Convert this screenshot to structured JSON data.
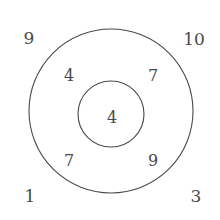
{
  "figure": {
    "type": "concentric-circle-region-diagram",
    "background_color": "#ffffff",
    "stroke_color": "#4a4a4a",
    "text_color": "#4a4a4a"
  },
  "shapes": {
    "outer_circle": {
      "name": "outer-circle",
      "cx": 111,
      "cy": 111,
      "r": 82,
      "stroke": "#4a4a4a",
      "stroke_width": 1.1,
      "fill": "none"
    },
    "inner_circle": {
      "name": "inner-circle",
      "cx": 111,
      "cy": 114,
      "r": 33,
      "stroke": "#4a4a4a",
      "stroke_width": 1.1,
      "fill": "none"
    }
  },
  "labels": {
    "outside": [
      {
        "id": "outside-top-left",
        "value": "9",
        "x": 29,
        "y": 38
      },
      {
        "id": "outside-top-right",
        "value": "10",
        "x": 194,
        "y": 39
      },
      {
        "id": "outside-bottom-left",
        "value": "1",
        "x": 30,
        "y": 196
      },
      {
        "id": "outside-bottom-right",
        "value": "3",
        "x": 196,
        "y": 196
      }
    ],
    "annulus": [
      {
        "id": "annulus-top-left",
        "value": "4",
        "x": 69,
        "y": 76
      },
      {
        "id": "annulus-top-right",
        "value": "7",
        "x": 153,
        "y": 76
      },
      {
        "id": "annulus-bottom-left",
        "value": "7",
        "x": 69,
        "y": 161
      },
      {
        "id": "annulus-bottom-right",
        "value": "9",
        "x": 153,
        "y": 161
      }
    ],
    "center": [
      {
        "id": "center-value",
        "value": "4",
        "x": 112,
        "y": 118
      }
    ]
  },
  "chart_data": {
    "type": "diagram",
    "title": "",
    "regions": [
      {
        "region": "outside-top-left",
        "label": "9",
        "value": 9
      },
      {
        "region": "outside-top-right",
        "label": "10",
        "value": 10
      },
      {
        "region": "outside-bottom-left",
        "label": "1",
        "value": 1
      },
      {
        "region": "outside-bottom-right",
        "label": "3",
        "value": 3
      },
      {
        "region": "annulus-top-left",
        "label": "4",
        "value": 4
      },
      {
        "region": "annulus-top-right",
        "label": "7",
        "value": 7
      },
      {
        "region": "annulus-bottom-left",
        "label": "7",
        "value": 7
      },
      {
        "region": "annulus-bottom-right",
        "label": "9",
        "value": 9
      },
      {
        "region": "center",
        "label": "4",
        "value": 4
      }
    ]
  }
}
